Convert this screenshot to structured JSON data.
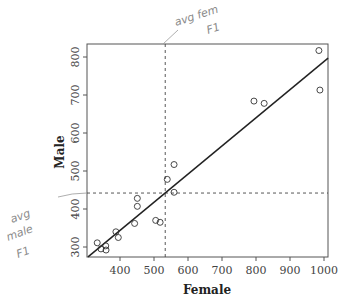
{
  "chart_data": {
    "type": "scatter",
    "title": "",
    "xlabel": "Female",
    "ylabel": "Male",
    "xlim": [
      305,
      1015
    ],
    "ylim": [
      273,
      833
    ],
    "x_ticks": [
      400,
      500,
      600,
      700,
      800,
      900,
      1000
    ],
    "y_ticks": [
      300,
      400,
      500,
      600,
      700,
      800
    ],
    "grid": false,
    "legend": null,
    "points": [
      {
        "x": 333,
        "y": 311
      },
      {
        "x": 344,
        "y": 295
      },
      {
        "x": 358,
        "y": 303
      },
      {
        "x": 359,
        "y": 292
      },
      {
        "x": 388,
        "y": 340
      },
      {
        "x": 395,
        "y": 325
      },
      {
        "x": 443,
        "y": 362
      },
      {
        "x": 451,
        "y": 428
      },
      {
        "x": 451,
        "y": 407
      },
      {
        "x": 505,
        "y": 370
      },
      {
        "x": 518,
        "y": 365
      },
      {
        "x": 539,
        "y": 478
      },
      {
        "x": 559,
        "y": 517
      },
      {
        "x": 559,
        "y": 444
      },
      {
        "x": 794,
        "y": 684
      },
      {
        "x": 824,
        "y": 678
      },
      {
        "x": 985,
        "y": 817
      },
      {
        "x": 988,
        "y": 713
      }
    ],
    "regression_line": {
      "x1": 306,
      "y1": 274,
      "x2": 1012,
      "y2": 797
    },
    "reference_lines": [
      {
        "orientation": "vertical",
        "value": 533,
        "style": "dashed",
        "label": "avg fem F1"
      },
      {
        "orientation": "horizontal",
        "value": 442,
        "style": "dashed",
        "label": "avg male F1"
      }
    ],
    "annotations": [
      {
        "text": "avg fem F1",
        "kind": "handwritten",
        "position": "top, pointing to vertical dashed line"
      },
      {
        "text": "avg male F1",
        "kind": "handwritten",
        "position": "left, pointing to horizontal dashed line"
      }
    ]
  },
  "axes": {
    "xlabel": "Female",
    "ylabel": "Male",
    "x_tick_labels": [
      "400",
      "500",
      "600",
      "700",
      "800",
      "900",
      "1000"
    ],
    "y_tick_labels": [
      "300",
      "400",
      "500",
      "600",
      "700",
      "800"
    ]
  },
  "annotations": {
    "fem_line1": "avg fem",
    "fem_line2": "F1",
    "male_line1": "avg",
    "male_line2": "male",
    "male_line3": "F1"
  }
}
